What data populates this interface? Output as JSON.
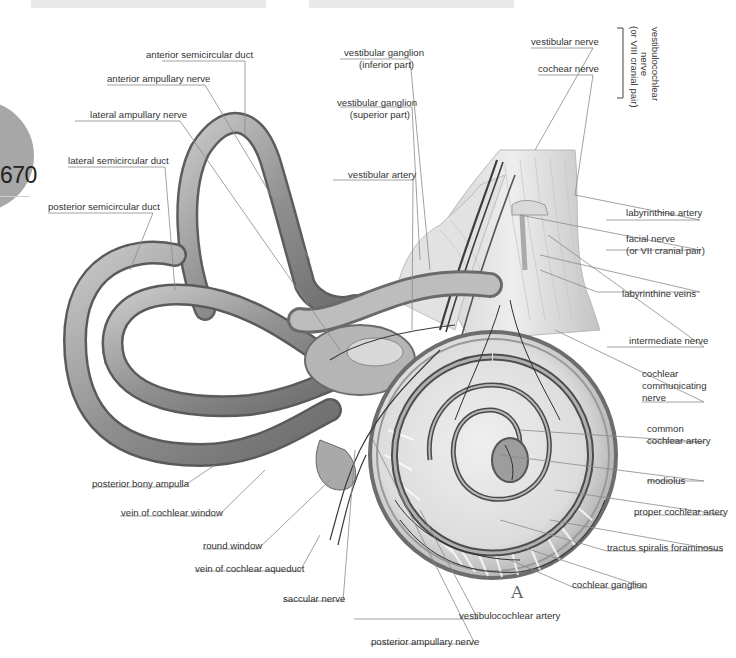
{
  "page": {
    "page_number": "670",
    "plate_letter": "A"
  },
  "labels": {
    "anterior_semicircular_duct": "anterior semicircular duct",
    "anterior_ampullary_nerve": "anterior ampullary nerve",
    "lateral_ampullary_nerve": "lateral ampullary nerve",
    "lateral_semicircular_duct": "lateral semicircular duct",
    "posterior_semicircular_duct": "posterior semicircular duct",
    "vestibular_ganglion_inferior": [
      "vestibular ganglion",
      "(inferior part)"
    ],
    "vestibular_ganglion_superior": [
      "vestibular ganglion",
      "(superior part)"
    ],
    "vestibular_artery": "vestibular artery",
    "vestibular_nerve": "vestibular nerve",
    "cochear_nerve": "cochear nerve",
    "vestibulocochlear_nerve": [
      "vestibulocochlear",
      "nerve",
      "(or VIII cranial pair)"
    ],
    "labyrinthine_artery": "labyrinthine artery",
    "facial_nerve": [
      "facial nerve",
      "(or VII cranial pair)"
    ],
    "labyrinthine_veins": "labyrinthine veins",
    "intermediate_nerve": "intermediate nerve",
    "cochlear_communicating_nerve": [
      "cochlear",
      "communicating",
      "nerve"
    ],
    "common_cochlear_artery": [
      "common",
      "cochlear artery"
    ],
    "modiolus": "modiolus",
    "proper_cochlear_artery": "proper cochlear artery",
    "tractus_spiralis_foraminosus": "tractus spiralis foraminosus",
    "cochlear_ganglion": "cochlear ganglion",
    "posterior_bony_ampulla": "posterior bony ampulla",
    "vein_of_cochlear_window": "vein of cochlear window",
    "round_window": "round window",
    "vein_of_cochlear_aqueduct": "vein of cochlear aqueduct",
    "saccular_nerve": "saccular nerve",
    "vestibulocochlear_artery": "vestibulocochlear artery",
    "posterior_ampullary_nerve": "posterior ampullary nerve"
  },
  "colors": {
    "tube_fill": "#9a9a9a",
    "tube_dark": "#555555",
    "tube_light": "#d6d6d6",
    "vessel": "#3a3a3a",
    "leader_line": "#8a8a8a",
    "label_text": "#333333",
    "page_disc": "#a7a7a7",
    "top_bar": "#e9e9e9"
  }
}
